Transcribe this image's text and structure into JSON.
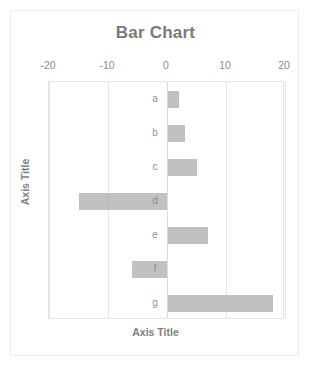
{
  "chart_data": {
    "type": "bar",
    "orientation": "horizontal",
    "title": "Bar Chart",
    "xlabel": "Axis Title",
    "ylabel": "Axis Title",
    "categories": [
      "a",
      "b",
      "c",
      "d",
      "e",
      "f",
      "g"
    ],
    "values": [
      2,
      3,
      5,
      -15,
      7,
      -6,
      18
    ],
    "series": [
      {
        "name": "Series 1",
        "values": [
          2,
          3,
          5,
          -15,
          7,
          -6,
          18
        ]
      }
    ],
    "xlim": [
      -20,
      20
    ],
    "xticks": [
      -20,
      -10,
      0,
      10,
      20
    ],
    "xtick_labels": [
      "-20",
      "-10",
      "0",
      "10",
      "20"
    ],
    "grid": true,
    "grid_axis": "x",
    "legend": false,
    "legend_position": "none",
    "bar_color": "#a9a9a9",
    "gridline_color": "#e4e4e4",
    "text_color": "#8c8c8c",
    "title_color": "#7a7a7a",
    "background": "#ffffff"
  }
}
